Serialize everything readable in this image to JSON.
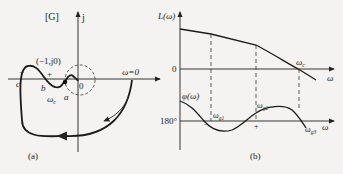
{
  "panel_a": {
    "title": "[G]",
    "imag_axis_label": "j",
    "point_label": "(−1,j0)",
    "omega_zero_label": "ω=0",
    "origin_label": "0",
    "crossing_labels": {
      "c": "c",
      "b": "b",
      "a": "a"
    },
    "omega_c_label": "ω",
    "omega_c_sub": "c",
    "sign_minus": "−",
    "sign_plus": "+",
    "caption": "(a)"
  },
  "panel_b": {
    "magnitude_axis_label": "L(ω)",
    "phase_axis_label": "φ(ω)",
    "zero_label": "0",
    "phase_ref_label": "180°",
    "x_axis_label_top": "ω",
    "x_axis_label_bottom": "ω",
    "omega_c_label": "ω",
    "omega_c_sub": "c",
    "omega_g1": "ω",
    "omega_g1_sub": "g1",
    "omega_g2": "ω",
    "omega_g2_sub": "g2",
    "omega_g3": "ω",
    "omega_g3_sub": "g3",
    "sign_minus": "−",
    "sign_plus": "+",
    "caption": "(b)"
  },
  "colors": {
    "ink": "#222222",
    "background": "#f4f3f1"
  }
}
